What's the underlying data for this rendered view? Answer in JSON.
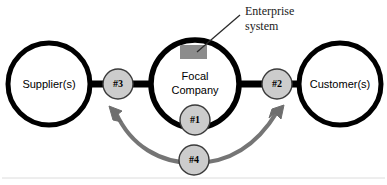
{
  "diagram": {
    "colors": {
      "stroke": "#000000",
      "marker_fill": "#cccccc",
      "marker_stroke": "#3a3a3a",
      "enterprise_fill": "#8c8c8c",
      "arrow": "#757575",
      "background": "#ffffff",
      "text": "#000000",
      "callout_text": "#1a1a1a",
      "baseline_rule": "#d8d8d8"
    },
    "nodes": [
      {
        "id": "supplier",
        "label": "Supplier(s)",
        "cx": 49,
        "cy": 84,
        "r": 41
      },
      {
        "id": "focal",
        "label_line1": "Focal",
        "label_line2": "Company",
        "cx": 195,
        "cy": 84,
        "r": 44
      },
      {
        "id": "customer",
        "label": "Customer(s)",
        "cx": 340,
        "cy": 84,
        "r": 41
      }
    ],
    "markers": [
      {
        "id": "m3",
        "label": "#3",
        "cx": 118,
        "cy": 84,
        "r": 15
      },
      {
        "id": "m2",
        "label": "#2",
        "cx": 277,
        "cy": 84,
        "r": 15
      },
      {
        "id": "m1",
        "label": "#1",
        "cx": 195,
        "cy": 120,
        "r": 15
      },
      {
        "id": "m4",
        "label": "#4",
        "cx": 194,
        "cy": 160,
        "r": 15
      }
    ],
    "enterprise_system": {
      "label_line1": "Enterprise",
      "label_line2": "system",
      "block_x": 180,
      "block_y": 45,
      "block_width": 27,
      "block_height": 14,
      "text_x": 246,
      "text_y": 14,
      "leader_from_x": 240,
      "leader_from_y": 14,
      "leader_to_x": 197,
      "leader_to_y": 51
    },
    "links": [
      {
        "id": "supplier-to-m3",
        "x1": 86,
        "y1": 84,
        "x2": 106,
        "y2": 84
      },
      {
        "id": "m3-to-focal",
        "x1": 130,
        "y1": 84,
        "x2": 154,
        "y2": 84
      },
      {
        "id": "focal-to-m2",
        "x1": 236,
        "y1": 84,
        "x2": 265,
        "y2": 84
      },
      {
        "id": "m2-to-customer",
        "x1": 289,
        "y1": 84,
        "x2": 303,
        "y2": 84
      }
    ],
    "feedback_arrow": {
      "id": "arrow-4",
      "label_ref": "#4",
      "double_headed": true,
      "left_tip_x": 110,
      "left_tip_y": 107,
      "right_tip_x": 283,
      "right_tip_y": 106,
      "mid_x": 194,
      "mid_y": 162
    }
  }
}
